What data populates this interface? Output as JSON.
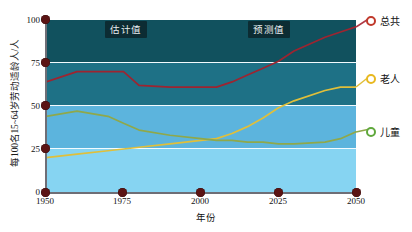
{
  "chart_data": {
    "type": "line",
    "title": "",
    "xlabel": "年份",
    "ylabel": "每100名15~64岁劳动适龄人/人",
    "xlim": [
      1950,
      2050
    ],
    "ylim": [
      0,
      100
    ],
    "xticks": [
      "1950",
      "1975",
      "2000",
      "2025",
      "2050"
    ],
    "yticks": [
      "0",
      "25",
      "50",
      "75",
      "100"
    ],
    "grid": true,
    "legend_position": "right",
    "x": [
      1950,
      1960,
      1970,
      1975,
      1980,
      1990,
      2000,
      2005,
      2010,
      2015,
      2020,
      2025,
      2030,
      2040,
      2045,
      2050
    ],
    "series": [
      {
        "name": "总共",
        "color": "#9e2430",
        "values": [
          64,
          70,
          70,
          70,
          62,
          61,
          61,
          61,
          64,
          68,
          72,
          76,
          82,
          90,
          93,
          96
        ]
      },
      {
        "name": "老人",
        "color": "#e0bf3a",
        "values": [
          20,
          22,
          24,
          25,
          26,
          28,
          30,
          31,
          34,
          38,
          43,
          49,
          53,
          59,
          61,
          61
        ]
      },
      {
        "name": "儿童",
        "color": "#8fa84a",
        "values": [
          44,
          47,
          44,
          40,
          36,
          33,
          31,
          30,
          30,
          29,
          29,
          28,
          28,
          29,
          31,
          35
        ]
      }
    ],
    "annotations": [
      {
        "text": "估计值",
        "x": 1973
      },
      {
        "text": "预测值",
        "x": 2024
      }
    ]
  },
  "legend": {
    "items": [
      {
        "label": "总共",
        "marker_color": "#c0392b",
        "marker": "circle-outline"
      },
      {
        "label": "老人",
        "marker_color": "#e8b820",
        "marker": "circle-outline"
      },
      {
        "label": "儿童",
        "marker_color": "#5fa83c",
        "marker": "circle-outline"
      }
    ]
  },
  "bands": {
    "colors": [
      "#11515e",
      "#1e7186",
      "#5cb4dd",
      "#86d4f2"
    ]
  }
}
